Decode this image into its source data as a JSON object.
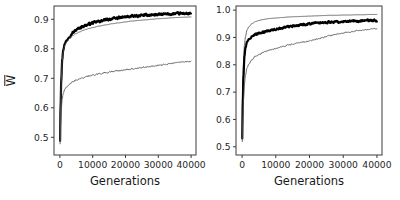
{
  "figure": {
    "panel_count": 2,
    "background_color": "#ffffff",
    "axis_color": "#3a3a3a"
  },
  "chart_data": [
    {
      "type": "line",
      "panel": "left",
      "title": "",
      "xlabel": "Generations",
      "ylabel": "W̅",
      "ylabel_plain": "W-bar",
      "xlim": [
        -1800,
        41500
      ],
      "ylim": [
        0.44,
        0.945
      ],
      "xticks": [
        0,
        10000,
        20000,
        30000,
        40000
      ],
      "xticklabels": [
        "0",
        "10000",
        "20000",
        "30000",
        "40000"
      ],
      "yticks": [
        0.5,
        0.6,
        0.7,
        0.8,
        0.9
      ],
      "yticklabels": [
        "0.5",
        "0.6",
        "0.7",
        "0.8",
        "0.9"
      ],
      "grid": false,
      "legend": "none",
      "x": [
        0,
        200,
        400,
        700,
        1000,
        1500,
        2000,
        3000,
        4000,
        5000,
        6000,
        7000,
        8000,
        9000,
        10000,
        12000,
        14000,
        16000,
        18000,
        20000,
        22000,
        24000,
        26000,
        28000,
        30000,
        32000,
        34000,
        36000,
        38000,
        40000
      ],
      "series": [
        {
          "name": "thick-black",
          "style": "thick-noisy",
          "color": "#000000",
          "linewidth": 2.2,
          "noise_amplitude": 0.006,
          "values": [
            0.462,
            0.6,
            0.69,
            0.762,
            0.795,
            0.818,
            0.828,
            0.843,
            0.855,
            0.864,
            0.871,
            0.876,
            0.88,
            0.884,
            0.888,
            0.893,
            0.898,
            0.902,
            0.905,
            0.908,
            0.91,
            0.912,
            0.914,
            0.915,
            0.916,
            0.917,
            0.918,
            0.919,
            0.92,
            0.918
          ]
        },
        {
          "name": "thin-smooth-upper",
          "style": "thin-smooth",
          "color": "#4f4f4f",
          "linewidth": 0.85,
          "noise_amplitude": 0.0,
          "values": [
            0.462,
            0.598,
            0.688,
            0.758,
            0.79,
            0.812,
            0.822,
            0.836,
            0.845,
            0.852,
            0.857,
            0.862,
            0.866,
            0.869,
            0.872,
            0.877,
            0.881,
            0.885,
            0.888,
            0.891,
            0.894,
            0.896,
            0.898,
            0.9,
            0.902,
            0.903,
            0.905,
            0.906,
            0.907,
            0.908
          ]
        },
        {
          "name": "thin-noisy-lower",
          "style": "thin-noisy",
          "color": "#4f4f4f",
          "linewidth": 0.85,
          "noise_amplitude": 0.0035,
          "values": [
            0.462,
            0.545,
            0.592,
            0.63,
            0.648,
            0.663,
            0.67,
            0.681,
            0.688,
            0.694,
            0.698,
            0.702,
            0.705,
            0.708,
            0.71,
            0.715,
            0.719,
            0.723,
            0.726,
            0.729,
            0.732,
            0.735,
            0.738,
            0.741,
            0.744,
            0.747,
            0.75,
            0.753,
            0.756,
            0.758
          ]
        }
      ]
    },
    {
      "type": "line",
      "panel": "right",
      "title": "",
      "xlabel": "Generations",
      "ylabel": "",
      "xlim": [
        -1800,
        41500
      ],
      "ylim": [
        0.47,
        1.015
      ],
      "xticks": [
        0,
        10000,
        20000,
        30000,
        40000
      ],
      "xticklabels": [
        "0",
        "10000",
        "20000",
        "30000",
        "40000"
      ],
      "yticks": [
        0.5,
        0.6,
        0.7,
        0.8,
        0.9,
        1.0
      ],
      "yticklabels": [
        "0.5",
        "0.6",
        "0.7",
        "0.8",
        "0.9",
        "1.0"
      ],
      "grid": false,
      "legend": "none",
      "x": [
        0,
        200,
        400,
        700,
        1000,
        1500,
        2000,
        3000,
        4000,
        5000,
        6000,
        7000,
        8000,
        9000,
        10000,
        12000,
        14000,
        16000,
        18000,
        20000,
        22000,
        24000,
        26000,
        28000,
        30000,
        32000,
        34000,
        36000,
        38000,
        40000
      ],
      "series": [
        {
          "name": "thin-smooth-upper",
          "style": "thin-smooth",
          "color": "#4f4f4f",
          "linewidth": 0.85,
          "noise_amplitude": 0.0,
          "values": [
            0.5,
            0.7,
            0.8,
            0.872,
            0.903,
            0.928,
            0.939,
            0.951,
            0.958,
            0.962,
            0.965,
            0.967,
            0.969,
            0.97,
            0.971,
            0.973,
            0.975,
            0.976,
            0.977,
            0.978,
            0.979,
            0.98,
            0.981,
            0.981,
            0.982,
            0.982,
            0.983,
            0.983,
            0.984,
            0.984
          ]
        },
        {
          "name": "thick-black",
          "style": "thick-noisy",
          "color": "#000000",
          "linewidth": 2.2,
          "noise_amplitude": 0.0055,
          "values": [
            0.5,
            0.66,
            0.755,
            0.83,
            0.862,
            0.884,
            0.893,
            0.903,
            0.91,
            0.915,
            0.919,
            0.922,
            0.925,
            0.928,
            0.93,
            0.935,
            0.939,
            0.943,
            0.947,
            0.95,
            0.952,
            0.954,
            0.956,
            0.957,
            0.958,
            0.959,
            0.96,
            0.961,
            0.962,
            0.961
          ]
        },
        {
          "name": "thin-noisy-lower",
          "style": "thin-noisy",
          "color": "#4f4f4f",
          "linewidth": 0.85,
          "noise_amplitude": 0.0035,
          "values": [
            0.5,
            0.6,
            0.668,
            0.73,
            0.762,
            0.79,
            0.803,
            0.82,
            0.831,
            0.838,
            0.844,
            0.849,
            0.853,
            0.857,
            0.86,
            0.867,
            0.873,
            0.878,
            0.883,
            0.887,
            0.893,
            0.9,
            0.906,
            0.912,
            0.916,
            0.92,
            0.924,
            0.927,
            0.93,
            0.932
          ]
        }
      ]
    }
  ]
}
